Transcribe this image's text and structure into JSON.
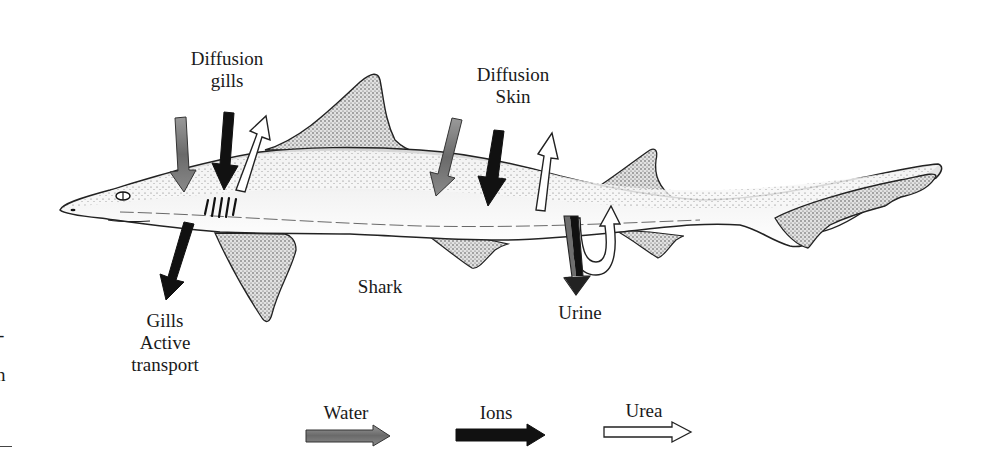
{
  "diagram": {
    "subject_label": "Shark",
    "labels": {
      "diffusion_gills": [
        "Diffusion",
        "gills"
      ],
      "diffusion_skin": [
        "Diffusion",
        "Skin"
      ],
      "gills_active": [
        "Gills",
        "Active",
        "transport"
      ],
      "urine": "Urine"
    },
    "legend": [
      {
        "label": "Water",
        "color": "#6e6e6e",
        "style": "gray-filled-arrow"
      },
      {
        "label": "Ions",
        "color": "#111111",
        "style": "black-filled-arrow"
      },
      {
        "label": "Urea",
        "color": "#ffffff",
        "style": "white-outlined-arrow"
      }
    ],
    "flows": [
      {
        "site": "gills",
        "substance": "Water",
        "direction": "in"
      },
      {
        "site": "gills",
        "substance": "Ions",
        "direction": "in"
      },
      {
        "site": "gills",
        "substance": "Urea",
        "direction": "out"
      },
      {
        "site": "skin",
        "substance": "Water",
        "direction": "in"
      },
      {
        "site": "skin",
        "substance": "Ions",
        "direction": "in"
      },
      {
        "site": "skin",
        "substance": "Urea",
        "direction": "out"
      },
      {
        "site": "gills-active-transport",
        "substance": "Ions",
        "direction": "out"
      },
      {
        "site": "urine",
        "substance": "Water+Ions",
        "direction": "out"
      },
      {
        "site": "urine",
        "substance": "Urea",
        "direction": "reabsorbed"
      }
    ],
    "left_edge_fragments": [
      "-",
      "n"
    ],
    "colors": {
      "water": "#6e6e6e",
      "ions": "#111111",
      "urea": "#ffffff",
      "outline": "#222222",
      "body_stipple": "#f1f1f1"
    }
  }
}
